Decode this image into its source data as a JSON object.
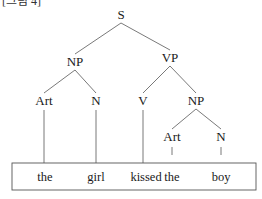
{
  "caption": "[그림 4]",
  "tree": {
    "nodes": [
      {
        "id": "S",
        "label": "S"
      },
      {
        "id": "NP1",
        "label": "NP"
      },
      {
        "id": "VP",
        "label": "VP"
      },
      {
        "id": "Art1",
        "label": "Art"
      },
      {
        "id": "N1",
        "label": "N"
      },
      {
        "id": "V",
        "label": "V"
      },
      {
        "id": "NP2",
        "label": "NP"
      },
      {
        "id": "Art2",
        "label": "Art"
      },
      {
        "id": "N2",
        "label": "N"
      }
    ],
    "edges": [
      [
        "S",
        "NP1"
      ],
      [
        "S",
        "VP"
      ],
      [
        "NP1",
        "Art1"
      ],
      [
        "NP1",
        "N1"
      ],
      [
        "VP",
        "V"
      ],
      [
        "VP",
        "NP2"
      ],
      [
        "NP2",
        "Art2"
      ],
      [
        "NP2",
        "N2"
      ]
    ],
    "leaves": [
      {
        "word": "the",
        "parent": "Art1"
      },
      {
        "word": "girl",
        "parent": "N1"
      },
      {
        "word": "kissed",
        "parent": "V"
      },
      {
        "word": "the",
        "parent": "Art2"
      },
      {
        "word": "boy",
        "parent": "N2"
      }
    ]
  }
}
